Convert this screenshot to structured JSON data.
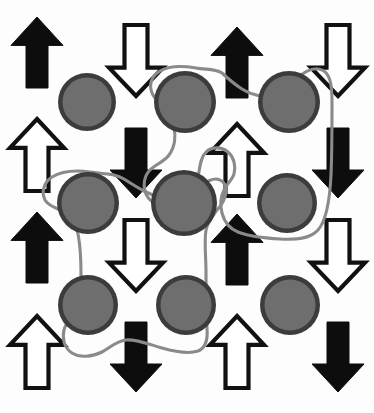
{
  "figure": {
    "width": 374,
    "height": 413,
    "background_color": "#fdfdfd"
  },
  "palette": {
    "arrow_black_fill": "#0d0d0d",
    "arrow_white_fill": "#ffffff",
    "arrow_outline": "#111111",
    "site_ring_color": "#3c3c3c",
    "site_core_color": "#6e6e6e",
    "contour_color": "#8a8a8a"
  },
  "legend": {
    "black_up_label": "spin up (flipped)",
    "white_up_label": "spin up",
    "black_down_label": "spin down (flipped)",
    "white_down_label": "spin down",
    "site_label": "lattice site",
    "contour_label": "cluster boundary"
  },
  "chart_data": {
    "type": "scatter",
    "xlabel": "",
    "ylabel": "",
    "xlim": [
      0,
      374
    ],
    "ylim": [
      0,
      413
    ],
    "grid": false,
    "legend_position": "none",
    "arrow_columns_x": [
      37,
      136,
      237,
      338
    ],
    "arrow_rows_y": [
      52,
      162,
      247,
      352
    ],
    "site_columns_x": [
      87,
      185,
      289
    ],
    "site_rows_y": [
      102,
      203,
      305
    ],
    "site_radius": 29,
    "arrows": [
      {
        "id": "arrow-r1c1",
        "col": 1,
        "row": 1,
        "cx": 37,
        "cy": 52,
        "direction": "up",
        "style": "black",
        "top": 17,
        "bottom": 88
      },
      {
        "id": "arrow-r1c2",
        "col": 2,
        "row": 1,
        "cx": 136,
        "cy": 60,
        "direction": "down",
        "style": "white",
        "top": 25,
        "bottom": 96
      },
      {
        "id": "arrow-r1c3",
        "col": 3,
        "row": 1,
        "cx": 237,
        "cy": 62,
        "direction": "up",
        "style": "black",
        "top": 27,
        "bottom": 98
      },
      {
        "id": "arrow-r1c4",
        "col": 4,
        "row": 1,
        "cx": 338,
        "cy": 60,
        "direction": "down",
        "style": "white",
        "top": 25,
        "bottom": 96
      },
      {
        "id": "arrow-r2c1",
        "col": 1,
        "row": 2,
        "cx": 37,
        "cy": 155,
        "direction": "up",
        "style": "white",
        "top": 119,
        "bottom": 191
      },
      {
        "id": "arrow-r2c2",
        "col": 2,
        "row": 2,
        "cx": 136,
        "cy": 163,
        "direction": "down",
        "style": "black",
        "top": 128,
        "bottom": 198
      },
      {
        "id": "arrow-r2c3",
        "col": 3,
        "row": 2,
        "cx": 237,
        "cy": 160,
        "direction": "up",
        "style": "white",
        "top": 124,
        "bottom": 196
      },
      {
        "id": "arrow-r2c4",
        "col": 4,
        "row": 2,
        "cx": 338,
        "cy": 163,
        "direction": "down",
        "style": "black",
        "top": 128,
        "bottom": 198
      },
      {
        "id": "arrow-r3c1",
        "col": 1,
        "row": 3,
        "cx": 37,
        "cy": 248,
        "direction": "up",
        "style": "black",
        "top": 212,
        "bottom": 283
      },
      {
        "id": "arrow-r3c2",
        "col": 2,
        "row": 3,
        "cx": 136,
        "cy": 255,
        "direction": "down",
        "style": "white",
        "top": 220,
        "bottom": 291
      },
      {
        "id": "arrow-r3c3",
        "col": 3,
        "row": 3,
        "cx": 237,
        "cy": 250,
        "direction": "up",
        "style": "black",
        "top": 214,
        "bottom": 285
      },
      {
        "id": "arrow-r3c4",
        "col": 4,
        "row": 3,
        "cx": 338,
        "cy": 255,
        "direction": "down",
        "style": "white",
        "top": 220,
        "bottom": 291
      },
      {
        "id": "arrow-r4c1",
        "col": 1,
        "row": 4,
        "cx": 37,
        "cy": 352,
        "direction": "up",
        "style": "white",
        "top": 316,
        "bottom": 388
      },
      {
        "id": "arrow-r4c2",
        "col": 2,
        "row": 4,
        "cx": 136,
        "cy": 357,
        "direction": "down",
        "style": "black",
        "top": 322,
        "bottom": 392
      },
      {
        "id": "arrow-r4c3",
        "col": 3,
        "row": 4,
        "cx": 237,
        "cy": 352,
        "direction": "up",
        "style": "white",
        "top": 316,
        "bottom": 388
      },
      {
        "id": "arrow-r4c4",
        "col": 4,
        "row": 4,
        "cx": 338,
        "cy": 357,
        "direction": "down",
        "style": "black",
        "top": 322,
        "bottom": 392
      }
    ],
    "sites": [
      {
        "id": "site-r1c1",
        "row": 1,
        "col": 1,
        "cx": 87,
        "cy": 102,
        "r": 29,
        "in_cluster": null
      },
      {
        "id": "site-r1c2",
        "row": 1,
        "col": 2,
        "cx": 185,
        "cy": 102,
        "r": 31,
        "in_cluster": "cluster-upper-right"
      },
      {
        "id": "site-r1c3",
        "row": 1,
        "col": 3,
        "cx": 289,
        "cy": 102,
        "r": 31,
        "in_cluster": "cluster-upper-right"
      },
      {
        "id": "site-r2c1",
        "row": 2,
        "col": 1,
        "cx": 88,
        "cy": 203,
        "r": 31,
        "in_cluster": "cluster-lower-left"
      },
      {
        "id": "site-r2c2",
        "row": 2,
        "col": 2,
        "cx": 184,
        "cy": 203,
        "r": 33,
        "in_cluster": "cluster-upper-right"
      },
      {
        "id": "site-r2c3",
        "row": 2,
        "col": 3,
        "cx": 287,
        "cy": 203,
        "r": 30,
        "in_cluster": "cluster-upper-right"
      },
      {
        "id": "site-r3c1",
        "row": 3,
        "col": 1,
        "cx": 88,
        "cy": 305,
        "r": 30,
        "in_cluster": "cluster-lower-left"
      },
      {
        "id": "site-r3c2",
        "row": 3,
        "col": 2,
        "cx": 186,
        "cy": 305,
        "r": 30,
        "in_cluster": "cluster-lower-left"
      },
      {
        "id": "site-r3c3",
        "row": 3,
        "col": 3,
        "cx": 290,
        "cy": 305,
        "r": 30,
        "in_cluster": null
      }
    ],
    "clusters": [
      {
        "id": "cluster-upper-right",
        "label": "upper-right cluster",
        "member_sites": [
          "site-r1c2",
          "site-r1c3",
          "site-r2c2",
          "site-r2c3"
        ],
        "site_count": 4
      },
      {
        "id": "cluster-lower-left",
        "label": "lower-left cluster",
        "member_sites": [
          "site-r2c1",
          "site-r3c1",
          "site-r3c2"
        ],
        "site_count": 3
      }
    ],
    "counts": {
      "total_arrows": 16,
      "black_arrows": 8,
      "white_arrows": 8,
      "up_arrows": 8,
      "down_arrows": 8,
      "total_sites": 9,
      "total_clusters": 2
    }
  }
}
